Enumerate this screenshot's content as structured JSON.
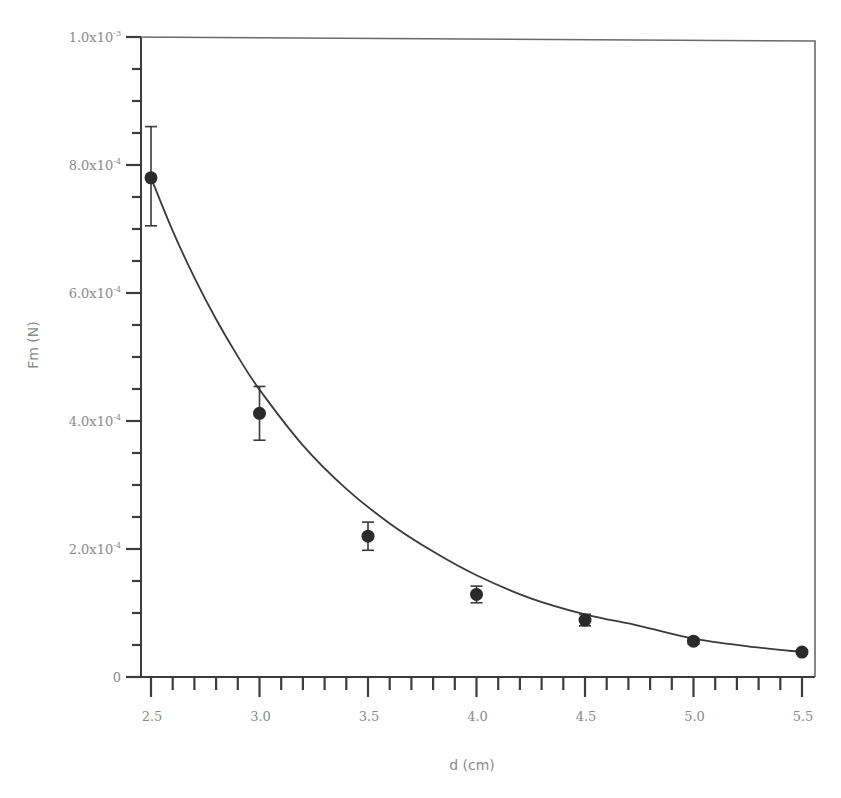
{
  "chart_data": {
    "type": "scatter",
    "title": "",
    "xlabel": "d (cm)",
    "ylabel": "Fm (N)",
    "xlim": [
      2.5,
      5.5
    ],
    "ylim": [
      0,
      0.001
    ],
    "grid": false,
    "legend": null,
    "x_ticks": [
      2.5,
      3.0,
      3.5,
      4.0,
      4.5,
      5.0,
      5.5
    ],
    "x_tick_labels": [
      "2.5",
      "3.0",
      "3.5",
      "4.0",
      "4.5",
      "5.0",
      "5.5"
    ],
    "x_minor_step": 0.1,
    "y_ticks": [
      0,
      0.0002,
      0.0004,
      0.0006,
      0.0008,
      0.001
    ],
    "y_tick_labels": [
      "0",
      "2.0x10-4",
      "4.0x10-4",
      "6.0x10-4",
      "8.0x10-4",
      "1.0x10-3"
    ],
    "y_minor_step": 5e-05,
    "series": [
      {
        "name": "measured",
        "style": "markers-with-error-bars",
        "x": [
          2.5,
          3.0,
          3.5,
          4.0,
          4.5,
          5.0,
          5.5
        ],
        "y": [
          0.00078,
          0.000412,
          0.00022,
          0.000129,
          8.9e-05,
          5.6e-05,
          3.9e-05
        ],
        "error_low": [
          0.000705,
          0.00037,
          0.000198,
          0.000116,
          8e-05,
          5.2e-05,
          3.6e-05
        ],
        "error_high": [
          0.00086,
          0.000454,
          0.000242,
          0.000142,
          9.8e-05,
          6e-05,
          4.2e-05
        ]
      },
      {
        "name": "fit",
        "style": "line",
        "x": [
          2.5,
          2.6,
          2.7,
          2.8,
          2.9,
          3.0,
          3.2,
          3.4,
          3.6,
          3.8,
          4.0,
          4.25,
          4.5,
          4.75,
          5.0,
          5.25,
          5.5
        ],
        "y": [
          0.00078,
          0.000697,
          0.000624,
          0.000559,
          0.000501,
          0.000449,
          0.000362,
          0.000294,
          0.00024,
          0.000196,
          0.000159,
          0.000123,
          9.8e-05,
          8e-05,
          6e-05,
          4.8e-05,
          3.9e-05
        ]
      }
    ]
  },
  "labels": {
    "x_axis": "d (cm)",
    "y_axis": "Fm (N)",
    "y_ticks": [
      {
        "mant": "0",
        "exp": ""
      },
      {
        "mant": "2.0x10",
        "exp": "-4"
      },
      {
        "mant": "4.0x10",
        "exp": "-4"
      },
      {
        "mant": "6.0x10",
        "exp": "-4"
      },
      {
        "mant": "8.0x10",
        "exp": "-4"
      },
      {
        "mant": "1.0x10",
        "exp": "-3"
      }
    ],
    "x_ticks": [
      "2.5",
      "3.0",
      "3.5",
      "4.0",
      "4.5",
      "5.0",
      "5.5"
    ]
  }
}
